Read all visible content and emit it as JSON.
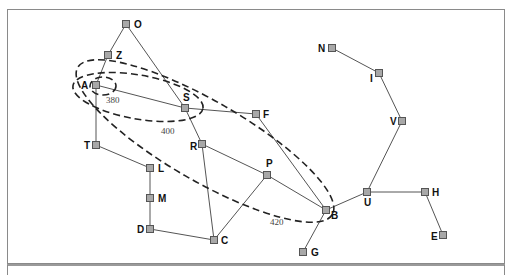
{
  "diagram": {
    "type": "graph-map-with-contours",
    "colors": {
      "node_fill": "#a8a8a8",
      "node_stroke": "#555555",
      "edge": "#555555",
      "contour": "#222222",
      "frame": "#888888"
    },
    "nodes": [
      {
        "id": "O",
        "label": "O",
        "x": 126,
        "y": 24,
        "lx": 134,
        "ly": 28
      },
      {
        "id": "Z",
        "label": "Z",
        "x": 108,
        "y": 55,
        "lx": 116,
        "ly": 59
      },
      {
        "id": "A",
        "label": "A",
        "x": 96,
        "y": 85,
        "lx": 81,
        "ly": 89
      },
      {
        "id": "S",
        "label": "S",
        "x": 185,
        "y": 108,
        "lx": 183,
        "ly": 101
      },
      {
        "id": "F",
        "label": "F",
        "x": 256,
        "y": 114,
        "lx": 263,
        "ly": 118
      },
      {
        "id": "T",
        "label": "T",
        "x": 96,
        "y": 145,
        "lx": 84,
        "ly": 149
      },
      {
        "id": "R",
        "label": "R",
        "x": 202,
        "y": 144,
        "lx": 190,
        "ly": 150
      },
      {
        "id": "L",
        "label": "L",
        "x": 150,
        "y": 168,
        "lx": 158,
        "ly": 172
      },
      {
        "id": "P",
        "label": "P",
        "x": 267,
        "y": 175,
        "lx": 266,
        "ly": 167
      },
      {
        "id": "M",
        "label": "M",
        "x": 150,
        "y": 198,
        "lx": 158,
        "ly": 202
      },
      {
        "id": "D",
        "label": "D",
        "x": 150,
        "y": 229,
        "lx": 137,
        "ly": 233
      },
      {
        "id": "C",
        "label": "C",
        "x": 214,
        "y": 240,
        "lx": 221,
        "ly": 244
      },
      {
        "id": "B",
        "label": "B",
        "x": 326,
        "y": 210,
        "lx": 331,
        "ly": 219
      },
      {
        "id": "U",
        "label": "U",
        "x": 367,
        "y": 192,
        "lx": 364,
        "ly": 206
      },
      {
        "id": "H",
        "label": "H",
        "x": 425,
        "y": 192,
        "lx": 432,
        "ly": 196
      },
      {
        "id": "E",
        "label": "E",
        "x": 443,
        "y": 235,
        "lx": 431,
        "ly": 240
      },
      {
        "id": "G",
        "label": "G",
        "x": 303,
        "y": 252,
        "lx": 311,
        "ly": 256
      },
      {
        "id": "N",
        "label": "N",
        "x": 332,
        "y": 48,
        "lx": 318,
        "ly": 52
      },
      {
        "id": "I",
        "label": "I",
        "x": 379,
        "y": 73,
        "lx": 370,
        "ly": 82
      },
      {
        "id": "V",
        "label": "V",
        "x": 402,
        "y": 121,
        "lx": 390,
        "ly": 125
      }
    ],
    "edges": [
      [
        "O",
        "Z"
      ],
      [
        "Z",
        "A"
      ],
      [
        "O",
        "S"
      ],
      [
        "A",
        "S"
      ],
      [
        "A",
        "T"
      ],
      [
        "T",
        "L"
      ],
      [
        "L",
        "M"
      ],
      [
        "M",
        "D"
      ],
      [
        "D",
        "C"
      ],
      [
        "S",
        "F"
      ],
      [
        "S",
        "R"
      ],
      [
        "R",
        "C"
      ],
      [
        "R",
        "P"
      ],
      [
        "P",
        "C"
      ],
      [
        "P",
        "B"
      ],
      [
        "F",
        "B"
      ],
      [
        "B",
        "G"
      ],
      [
        "B",
        "U"
      ],
      [
        "U",
        "H"
      ],
      [
        "H",
        "E"
      ],
      [
        "U",
        "V"
      ],
      [
        "V",
        "I"
      ],
      [
        "I",
        "N"
      ]
    ],
    "contours": [
      {
        "label": "380",
        "label_x": 106,
        "label_y": 103,
        "cx": 103,
        "cy": 86,
        "rx": 13,
        "ry": 9,
        "rot": 0
      },
      {
        "label": "400",
        "label_x": 161,
        "label_y": 134,
        "cx": 138,
        "cy": 97,
        "rx": 66,
        "ry": 22,
        "rot": 10
      },
      {
        "label": "420",
        "label_x": 270,
        "label_y": 225,
        "cx": 205,
        "cy": 141,
        "rx": 147,
        "ry": 40,
        "rot": 30
      }
    ]
  }
}
